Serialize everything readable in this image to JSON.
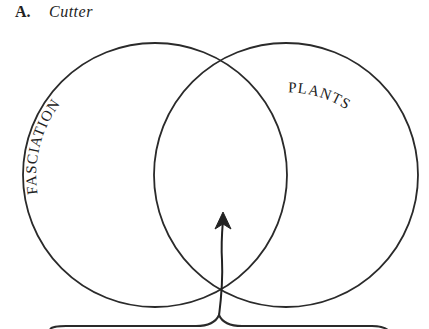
{
  "caption": {
    "letter": "A.",
    "author": "Cutter"
  },
  "venn": {
    "sets": [
      {
        "id": "left",
        "label": "FASCIATION",
        "cx": 155,
        "cy": 175,
        "r": 132
      },
      {
        "id": "right",
        "label": "PLANTS",
        "cx": 286,
        "cy": 175,
        "r": 132
      }
    ],
    "arrow": {
      "from": "brace-cusp",
      "to": "intersection",
      "tip_x": 223,
      "tip_y": 214
    },
    "brace": {
      "x_start": 50,
      "x_end": 386,
      "y": 326,
      "cusp_x": 219,
      "cusp_y": 315
    },
    "stroke_color": "#2a2a2a"
  }
}
